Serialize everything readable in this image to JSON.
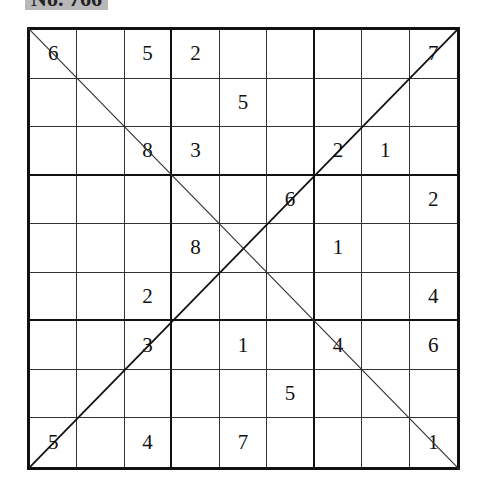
{
  "puzzle": {
    "label": "No. 766",
    "type": "X-Sudoku (diagonal)",
    "grid": [
      [
        "6",
        "",
        "5",
        "2",
        "",
        "",
        "",
        "",
        "7"
      ],
      [
        "",
        "",
        "",
        "",
        "5",
        "",
        "",
        "",
        ""
      ],
      [
        "",
        "",
        "8",
        "3",
        "",
        "",
        "2",
        "1",
        ""
      ],
      [
        "",
        "",
        "",
        "",
        "",
        "6",
        "",
        "",
        "2"
      ],
      [
        "",
        "",
        "",
        "8",
        "",
        "",
        "1",
        "",
        ""
      ],
      [
        "",
        "",
        "2",
        "",
        "",
        "",
        "",
        "",
        "4"
      ],
      [
        "",
        "",
        "3",
        "",
        "1",
        "",
        "4",
        "",
        "6"
      ],
      [
        "",
        "",
        "",
        "",
        "",
        "5",
        "",
        "",
        ""
      ],
      [
        "5",
        "",
        "4",
        "",
        "7",
        "",
        "",
        "",
        "1"
      ]
    ]
  },
  "colors": {
    "lines": "#111111",
    "label_bg": "#b8b8b8",
    "background": "#ffffff"
  }
}
